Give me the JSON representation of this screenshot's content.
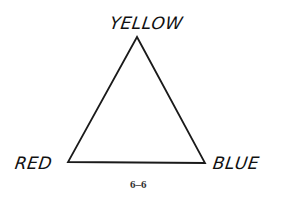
{
  "diagram": {
    "type": "color-triangle",
    "vertices": [
      {
        "label": "YELLOW",
        "position": "top"
      },
      {
        "label": "RED",
        "position": "bottom-left"
      },
      {
        "label": "BLUE",
        "position": "bottom-right"
      }
    ],
    "caption": "6–6",
    "stroke_color": "#1a1a1a"
  }
}
